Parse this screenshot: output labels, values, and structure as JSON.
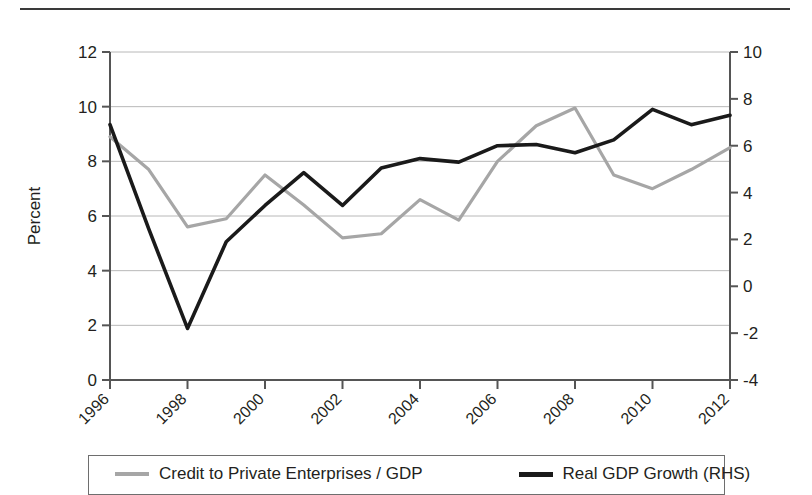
{
  "chart_data": {
    "type": "line",
    "title": "",
    "xlabel": "",
    "ylabel": "Percent",
    "ylabel_right": "",
    "x": [
      1996,
      1997,
      1998,
      1999,
      2000,
      2001,
      2002,
      2003,
      2004,
      2005,
      2006,
      2007,
      2008,
      2009,
      2010,
      2011,
      2012
    ],
    "xtick_labels": [
      "1996",
      "1998",
      "2000",
      "2002",
      "2004",
      "2006",
      "2008",
      "2010",
      "2012"
    ],
    "xticks": [
      1996,
      1998,
      2000,
      2002,
      2004,
      2006,
      2008,
      2010,
      2012
    ],
    "xlim": [
      1996,
      2012
    ],
    "ylim": [
      0,
      12
    ],
    "yticks": [
      0,
      2,
      4,
      6,
      8,
      10,
      12
    ],
    "ytick_labels": [
      "0",
      "2",
      "4",
      "6",
      "8",
      "10",
      "12"
    ],
    "ylim_right": [
      -4,
      10
    ],
    "yticks_right": [
      -4,
      -2,
      0,
      2,
      4,
      6,
      8,
      10
    ],
    "ytick_labels_right": [
      "-4",
      "-2",
      "0",
      "2",
      "4",
      "6",
      "8",
      "10"
    ],
    "grid": true,
    "grid_axis": "y",
    "legend_position": "bottom",
    "series": [
      {
        "name": "Credit to Private Enterprises / GDP",
        "axis": "left",
        "color": "#a6a6a6",
        "linewidth": 3.2,
        "values": [
          8.9,
          7.7,
          5.6,
          5.9,
          7.5,
          6.4,
          5.2,
          5.35,
          6.6,
          5.85,
          8.0,
          9.3,
          9.95,
          7.5,
          7.0,
          7.7,
          8.5
        ]
      },
      {
        "name": "Real GDP Growth (RHS)",
        "axis": "right",
        "color": "#1a1a1a",
        "linewidth": 3.6,
        "values": [
          6.9,
          2.45,
          -1.8,
          1.9,
          3.45,
          4.85,
          3.45,
          5.05,
          5.45,
          5.3,
          6.0,
          6.05,
          5.7,
          6.25,
          7.55,
          6.9,
          7.3
        ]
      }
    ]
  },
  "legend": {
    "entries": [
      {
        "label": "Credit to Private Enterprises / GDP",
        "color": "#a6a6a6"
      },
      {
        "label": "Real GDP Growth (RHS)",
        "color": "#1a1a1a"
      }
    ]
  },
  "axes": {
    "y_left_title": "Percent"
  }
}
